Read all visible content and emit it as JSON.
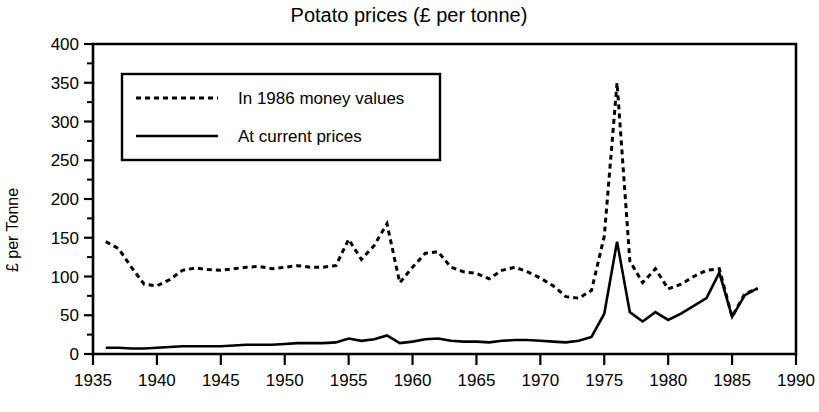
{
  "chart_data": {
    "type": "line",
    "title": "Potato prices (£ per tonne)",
    "xlabel": "",
    "ylabel": "£ per Tonne",
    "xlim": [
      1935,
      1990
    ],
    "ylim": [
      0,
      400
    ],
    "xticks": [
      1935,
      1940,
      1945,
      1950,
      1955,
      1960,
      1965,
      1970,
      1975,
      1980,
      1985,
      1990
    ],
    "yticks": [
      0,
      50,
      100,
      150,
      200,
      250,
      300,
      350,
      400
    ],
    "y_minor_step": 25,
    "x_tick_labels": [
      "1935",
      "1940",
      "1945",
      "1950",
      "1955",
      "1960",
      "1965",
      "1970",
      "1975",
      "1980",
      "1985",
      "1990"
    ],
    "y_tick_labels": [
      "0",
      "50",
      "100",
      "150",
      "200",
      "250",
      "300",
      "350",
      "400"
    ],
    "grid": false,
    "legend_position": "upper-left",
    "series": [
      {
        "name": "In 1986 money values",
        "style": "dotted",
        "color": "#000000",
        "x": [
          1936,
          1937,
          1938,
          1939,
          1940,
          1941,
          1942,
          1943,
          1944,
          1945,
          1946,
          1947,
          1948,
          1949,
          1950,
          1951,
          1952,
          1953,
          1954,
          1955,
          1956,
          1957,
          1958,
          1959,
          1960,
          1961,
          1962,
          1963,
          1964,
          1965,
          1966,
          1967,
          1968,
          1969,
          1970,
          1971,
          1972,
          1973,
          1974,
          1975,
          1976,
          1977,
          1978,
          1979,
          1980,
          1981,
          1982,
          1983,
          1984,
          1985,
          1986,
          1987
        ],
        "values": [
          145,
          136,
          112,
          90,
          88,
          96,
          108,
          111,
          109,
          108,
          110,
          112,
          113,
          110,
          112,
          114,
          112,
          112,
          114,
          148,
          122,
          140,
          168,
          92,
          112,
          130,
          132,
          112,
          106,
          104,
          97,
          108,
          112,
          106,
          98,
          88,
          74,
          72,
          82,
          152,
          350,
          120,
          92,
          110,
          84,
          90,
          100,
          108,
          110,
          48,
          78,
          84
        ]
      },
      {
        "name": "At current prices",
        "style": "solid",
        "color": "#000000",
        "x": [
          1936,
          1937,
          1938,
          1939,
          1940,
          1941,
          1942,
          1943,
          1944,
          1945,
          1946,
          1947,
          1948,
          1949,
          1950,
          1951,
          1952,
          1953,
          1954,
          1955,
          1956,
          1957,
          1958,
          1959,
          1960,
          1961,
          1962,
          1963,
          1964,
          1965,
          1966,
          1967,
          1968,
          1969,
          1970,
          1971,
          1972,
          1973,
          1974,
          1975,
          1976,
          1977,
          1978,
          1979,
          1980,
          1981,
          1982,
          1983,
          1984,
          1985,
          1986,
          1987
        ],
        "values": [
          8,
          8,
          7,
          7,
          8,
          9,
          10,
          10,
          10,
          10,
          11,
          12,
          12,
          12,
          13,
          14,
          14,
          14,
          15,
          20,
          17,
          19,
          24,
          14,
          16,
          19,
          20,
          17,
          16,
          16,
          15,
          17,
          18,
          18,
          17,
          16,
          15,
          17,
          22,
          52,
          145,
          54,
          42,
          54,
          44,
          52,
          62,
          72,
          105,
          48,
          76,
          85
        ]
      }
    ],
    "annotations": []
  },
  "legend": {
    "entries": [
      {
        "label": "In 1986 money values",
        "style": "dotted"
      },
      {
        "label": "At current prices",
        "style": "solid"
      }
    ]
  },
  "title": "Potato prices (£ per tonne)",
  "colors": {
    "background": "#ffffff",
    "ink": "#000000"
  }
}
